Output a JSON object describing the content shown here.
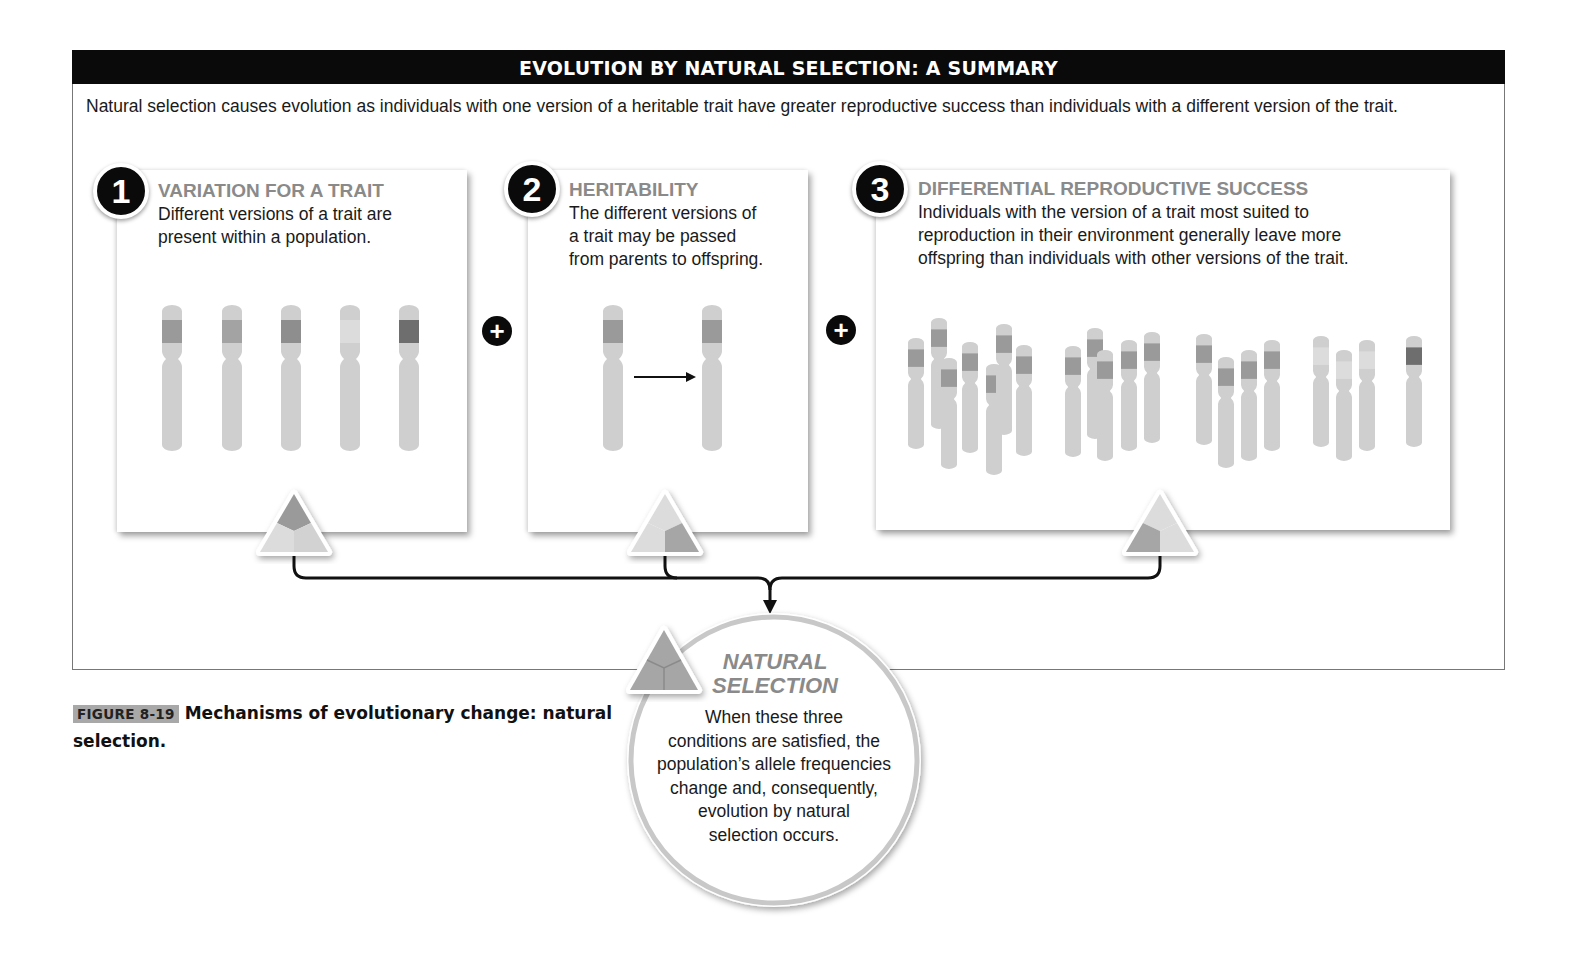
{
  "header": {
    "title": "EVOLUTION BY NATURAL SELECTION: A SUMMARY",
    "intro": "Natural selection causes evolution as individuals with one version of a heritable trait have greater reproductive success than individuals with a different version of the trait."
  },
  "conditions": [
    {
      "number": "1",
      "title": "VARIATION FOR A TRAIT",
      "lines": [
        "Different versions of a trait are",
        "present within a population."
      ],
      "icon": "triangle-segment-top-dark"
    },
    {
      "number": "2",
      "title": "HERITABILITY",
      "lines": [
        "The different versions of",
        "a trait may be passed",
        "from parents to offspring."
      ],
      "icon": "triangle-segment-right-dark"
    },
    {
      "number": "3",
      "title": "DIFFERENTIAL REPRODUCTIVE SUCCESS",
      "lines": [
        "Individuals with the version of a trait most suited to",
        "reproduction in their environment generally leave more",
        "offspring than individuals with other versions of the trait."
      ],
      "icon": "triangle-segment-left-dark"
    }
  ],
  "connectors": {
    "plus_symbol": "+"
  },
  "result": {
    "title_line1": "NATURAL",
    "title_line2": "SELECTION",
    "lines": [
      "When these three",
      "conditions are satisfied, the",
      "population’s allele frequencies",
      "change and, consequently,",
      "evolution by natural",
      "selection occurs."
    ]
  },
  "caption": {
    "label": "FIGURE 8-19",
    "text": "Mechanisms of evolutionary change: natural selection."
  },
  "colors": {
    "title_bar": "#0a0a0a",
    "heading_gray": "#8a8a8a",
    "chromosome": "#cfcfcf",
    "band_medium": "#9a9a9a",
    "band_light": "#dcdcdc",
    "band_dark": "#6e6e6e"
  }
}
